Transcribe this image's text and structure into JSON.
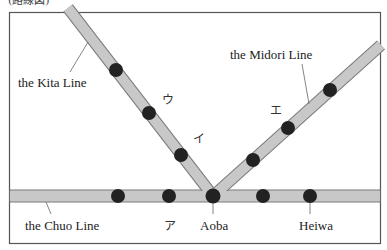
{
  "caption": "(路線図)",
  "colors": {
    "line_fill": "#c8c8c8",
    "line_edge": "#7a7a7a",
    "station": "#222222",
    "frame": "#555555"
  },
  "lines": {
    "kita": {
      "label": "the Kita Line"
    },
    "midori": {
      "label": "the Midori Line"
    },
    "chuo": {
      "label": "the Chuo Line"
    }
  },
  "stations": {
    "aoba": "Aoba",
    "heiwa": "Heiwa",
    "a": "ア",
    "i": "イ",
    "u": "ウ",
    "e": "エ"
  }
}
